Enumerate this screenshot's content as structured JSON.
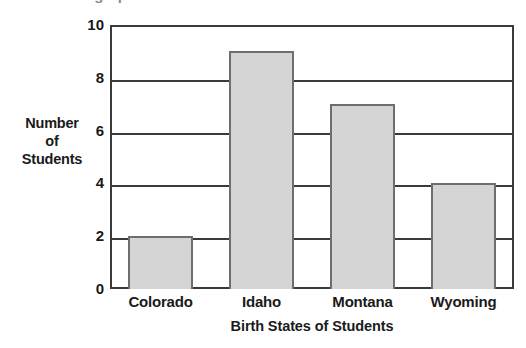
{
  "top_remnant": {
    "text": "Use the graph to choose the best answer."
  },
  "chart_data": {
    "type": "bar",
    "title": "",
    "categories": [
      "Colorado",
      "Idaho",
      "Montana",
      "Wyoming"
    ],
    "values": [
      2,
      9,
      7,
      4
    ],
    "xlabel": "Birth States of Students",
    "ylabel": "Number of Students",
    "ylabel_lines": [
      "Number",
      "of",
      "Students"
    ],
    "ylim": [
      0,
      10
    ],
    "ytick_values": [
      0,
      2,
      4,
      6,
      8,
      10
    ],
    "ytick_labels": [
      "0",
      "2",
      "4",
      "6",
      "8",
      "10"
    ],
    "grid": true,
    "grid_axis": "y",
    "legend": false,
    "bar_fill_color": "#d5d5d5",
    "bar_border_color": "#6e6e6e",
    "axis_color": "#3a3a3a",
    "background_color": "#ffffff"
  }
}
